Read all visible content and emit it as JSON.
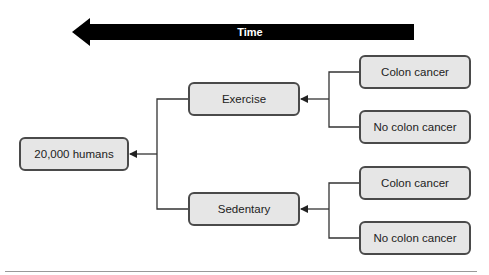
{
  "diagram": {
    "time_arrow": {
      "label": "Time",
      "direction": "left",
      "color": "#000000"
    },
    "root": {
      "label": "20,000 humans"
    },
    "groups": [
      {
        "label": "Exercise",
        "outcomes": [
          {
            "label": "Colon cancer"
          },
          {
            "label": "No colon cancer"
          }
        ]
      },
      {
        "label": "Sedentary",
        "outcomes": [
          {
            "label": "Colon cancer"
          },
          {
            "label": "No colon cancer"
          }
        ]
      }
    ],
    "colors": {
      "box_fill": "#e6e6e6",
      "box_border": "#4a4a4a",
      "line": "#333333"
    }
  }
}
